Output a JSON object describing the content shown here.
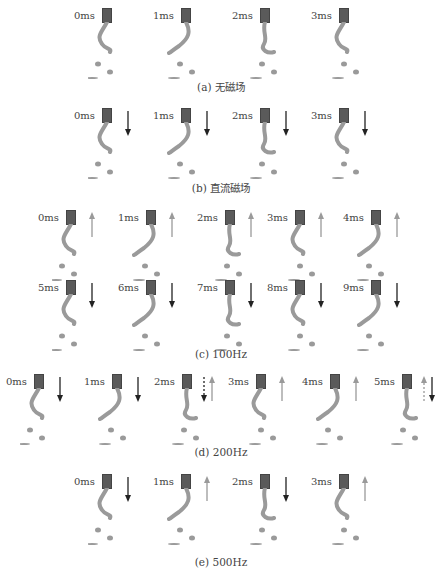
{
  "colors": {
    "nozzle": "#5b5b5b",
    "fluid": "#9a9a9a",
    "arrow_down": "#222222",
    "arrow_up": "#9a9a9a",
    "text": "#444444"
  },
  "panels": [
    {
      "caption": "(a) 无磁场",
      "y": 8,
      "frames": [
        {
          "label": "0ms",
          "x": 74,
          "arrow": "none"
        },
        {
          "label": "1ms",
          "x": 153,
          "arrow": "none"
        },
        {
          "label": "2ms",
          "x": 232,
          "arrow": "none"
        },
        {
          "label": "3ms",
          "x": 311,
          "arrow": "none"
        }
      ]
    },
    {
      "caption": "(b) 直流磁场",
      "y": 108,
      "frames": [
        {
          "label": "0ms",
          "x": 74,
          "arrow": "down"
        },
        {
          "label": "1ms",
          "x": 153,
          "arrow": "down"
        },
        {
          "label": "2ms",
          "x": 232,
          "arrow": "down"
        },
        {
          "label": "3ms",
          "x": 311,
          "arrow": "down"
        }
      ]
    },
    {
      "caption": "(c) 100Hz",
      "rows": [
        {
          "y": 210,
          "frames": [
            {
              "label": "0ms",
              "x": 38,
              "arrow": "up"
            },
            {
              "label": "1ms",
              "x": 118,
              "arrow": "up"
            },
            {
              "label": "2ms",
              "x": 197,
              "arrow": "up"
            },
            {
              "label": "3ms",
              "x": 267,
              "arrow": "up"
            },
            {
              "label": "4ms",
              "x": 343,
              "arrow": "up"
            }
          ]
        },
        {
          "y": 280,
          "frames": [
            {
              "label": "5ms",
              "x": 38,
              "arrow": "down"
            },
            {
              "label": "6ms",
              "x": 118,
              "arrow": "down"
            },
            {
              "label": "7ms",
              "x": 197,
              "arrow": "down"
            },
            {
              "label": "8ms",
              "x": 267,
              "arrow": "down"
            },
            {
              "label": "9ms",
              "x": 343,
              "arrow": "down"
            }
          ]
        }
      ]
    },
    {
      "caption": "(d) 200Hz",
      "y": 374,
      "frames": [
        {
          "label": "0ms",
          "x": 6,
          "arrow": "down"
        },
        {
          "label": "1ms",
          "x": 84,
          "arrow": "down"
        },
        {
          "label": "2ms",
          "x": 154,
          "arrow": "dashed-down-up"
        },
        {
          "label": "3ms",
          "x": 228,
          "arrow": "up"
        },
        {
          "label": "4ms",
          "x": 302,
          "arrow": "up"
        },
        {
          "label": "5ms",
          "x": 374,
          "arrow": "dashed-up-down"
        }
      ]
    },
    {
      "caption": "(e) 500Hz",
      "y": 474,
      "frames": [
        {
          "label": "0ms",
          "x": 74,
          "arrow": "down"
        },
        {
          "label": "1ms",
          "x": 153,
          "arrow": "up"
        },
        {
          "label": "2ms",
          "x": 232,
          "arrow": "down"
        },
        {
          "label": "3ms",
          "x": 311,
          "arrow": "up"
        }
      ]
    }
  ],
  "captions": {
    "a": "(a) 无磁场",
    "b": "(b) 直流磁场",
    "c": "(c) 100Hz",
    "d": "(d) 200Hz",
    "e": "(e) 500Hz"
  }
}
